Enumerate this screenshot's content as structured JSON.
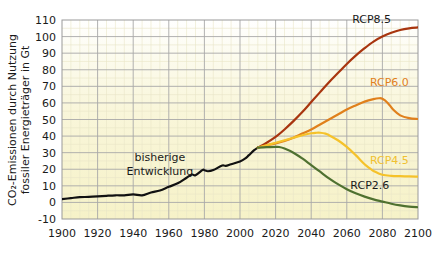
{
  "chart_data": {
    "type": "line",
    "title": "",
    "subtitle": "",
    "xlabel": "",
    "ylabel": "CO₂-Emissionen durch Nutzung fossiler Energieträger in Gt",
    "ylabel_line1": "CO₂-Emissionen durch Nutzung",
    "ylabel_line2": "fossiler Energieträger in Gt",
    "xlim": [
      1900,
      2100
    ],
    "ylim": [
      -10,
      110
    ],
    "x_ticks": [
      1900,
      1920,
      1940,
      1960,
      1980,
      2000,
      2020,
      2040,
      2060,
      2080,
      2100
    ],
    "y_ticks": [
      -10,
      0,
      10,
      20,
      30,
      40,
      50,
      60,
      70,
      80,
      90,
      100,
      110
    ],
    "x_tick_labels": [
      "1900",
      "1920",
      "1940",
      "1960",
      "1980",
      "2000",
      "2020",
      "2040",
      "2060",
      "2080",
      "2100"
    ],
    "y_tick_labels": [
      "-10",
      "0",
      "10",
      "20",
      "30",
      "40",
      "50",
      "60",
      "70",
      "80",
      "90",
      "100",
      "110"
    ],
    "grid": true,
    "minor_grid": true,
    "legend_position": "inline-right",
    "plot_background": "#f7f4d0",
    "series": [
      {
        "name": "bisherige Entwicklung",
        "label": "bisherige Entwicklung",
        "color": "#111111",
        "width": 2.2,
        "label_x": 1952,
        "label_y": 24,
        "x": [
          1900,
          1905,
          1910,
          1915,
          1920,
          1925,
          1930,
          1935,
          1940,
          1945,
          1950,
          1955,
          1960,
          1965,
          1970,
          1973,
          1975,
          1979,
          1980,
          1982,
          1985,
          1990,
          1992,
          1995,
          2000,
          2003,
          2005,
          2008,
          2010
        ],
        "y": [
          2.0,
          2.6,
          3.2,
          3.3,
          3.6,
          4.0,
          4.3,
          4.3,
          4.8,
          4.3,
          6.0,
          7.2,
          9.4,
          11.5,
          14.9,
          16.8,
          16.4,
          19.6,
          19.4,
          18.8,
          19.5,
          22.3,
          22.0,
          23.0,
          24.7,
          26.5,
          28.5,
          31.5,
          33.0
        ]
      },
      {
        "name": "RCP8.5",
        "label": "RCP8.5",
        "color": "#a8350f",
        "width": 2.2,
        "label_x": 2063,
        "label_y": 108,
        "label_color": "#1a1a1a",
        "x": [
          2010,
          2015,
          2020,
          2025,
          2030,
          2035,
          2040,
          2045,
          2050,
          2055,
          2060,
          2065,
          2070,
          2075,
          2080,
          2085,
          2090,
          2095,
          2100
        ],
        "y": [
          33.0,
          36.0,
          39.5,
          44.0,
          49.0,
          54.5,
          60.5,
          66.5,
          72.5,
          78.0,
          83.5,
          88.5,
          93.0,
          97.0,
          100.0,
          102.3,
          104.0,
          105.0,
          105.5
        ]
      },
      {
        "name": "RCP6.0",
        "label": "RCP6.0",
        "color": "#e0801c",
        "width": 2.2,
        "label_x": 2073,
        "label_y": 70,
        "label_color": "#e0801c",
        "x": [
          2010,
          2015,
          2020,
          2025,
          2030,
          2035,
          2040,
          2045,
          2050,
          2055,
          2060,
          2065,
          2070,
          2075,
          2078,
          2080,
          2083,
          2086,
          2090,
          2095,
          2100
        ],
        "y": [
          33.0,
          34.5,
          35.5,
          37.0,
          39.0,
          41.5,
          44.0,
          47.0,
          50.0,
          53.0,
          56.0,
          58.5,
          60.8,
          62.3,
          62.8,
          62.5,
          60.0,
          56.0,
          52.5,
          50.8,
          50.3
        ]
      },
      {
        "name": "RCP4.5",
        "label": "RCP4.5",
        "color": "#f5c22a",
        "width": 2.2,
        "label_x": 2073,
        "label_y": 23,
        "label_color": "#f0c030",
        "x": [
          2010,
          2015,
          2020,
          2025,
          2030,
          2035,
          2040,
          2043,
          2045,
          2048,
          2050,
          2055,
          2060,
          2065,
          2070,
          2073,
          2075,
          2080,
          2085,
          2090,
          2095,
          2100
        ],
        "y": [
          33.0,
          34.5,
          36.0,
          37.5,
          39.0,
          40.5,
          41.7,
          42.0,
          42.0,
          41.5,
          40.5,
          37.5,
          33.5,
          28.5,
          23.0,
          20.5,
          19.0,
          16.7,
          16.0,
          15.8,
          15.7,
          15.5
        ]
      },
      {
        "name": "RCP2.6",
        "label": "RCP2.6",
        "color": "#4f7130",
        "width": 2.2,
        "label_x": 2062,
        "label_y": 8,
        "label_color": "#1a1a1a",
        "x": [
          2010,
          2015,
          2020,
          2022,
          2025,
          2030,
          2035,
          2040,
          2045,
          2050,
          2055,
          2060,
          2065,
          2070,
          2075,
          2080,
          2085,
          2090,
          2095,
          2100
        ],
        "y": [
          33.0,
          33.3,
          33.5,
          33.4,
          32.5,
          30.0,
          26.5,
          22.5,
          18.5,
          14.5,
          11.0,
          8.0,
          5.5,
          3.5,
          1.8,
          0.5,
          -0.8,
          -1.8,
          -2.5,
          -2.9
        ]
      }
    ],
    "annotations": [
      {
        "name": "historical-annotation",
        "text_line1": "bisherige",
        "text_line2": "Entwicklung",
        "x": 1955,
        "y": 25
      }
    ]
  }
}
